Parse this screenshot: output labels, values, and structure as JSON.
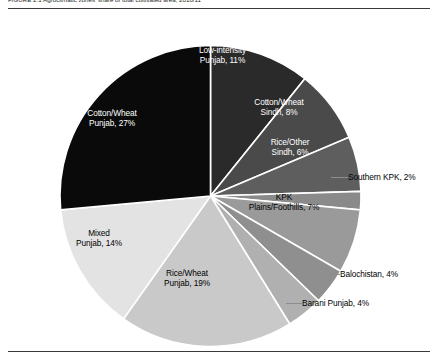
{
  "figure": {
    "caption": "FIGURE 2.1  Agroclimatic zones' share of total cultivated area, 2010/11",
    "rule_color": "#3a3a3a"
  },
  "chart_data": {
    "type": "pie",
    "title": "Agroclimatic zones' share of total cultivated area, 2010/11",
    "xlabel": "",
    "ylabel": "",
    "legend_position": "none",
    "grid": false,
    "start_angle_deg": 0,
    "direction": "clockwise",
    "unit": "percent",
    "categories": [
      "Low-intensity Punjab",
      "Cotton/Wheat Sindh",
      "Rice/Other Sindh",
      "Southern KPK",
      "KPK Plains/Foothills",
      "Balochistan",
      "Barani Punjab",
      "Rice/Wheat Punjab",
      "Mixed Punjab",
      "Cotton/Wheat Punjab"
    ],
    "values": [
      11,
      8,
      6,
      2,
      7,
      4,
      4,
      19,
      14,
      27
    ],
    "colors": [
      "#2a2a2a",
      "#4a4a4a",
      "#5e5e5e",
      "#8a8a8a",
      "#9a9a9a",
      "#8f8f8f",
      "#b0b0b0",
      "#c9c9c9",
      "#e3e3e3",
      "#0a0a0a"
    ],
    "slices": [
      {
        "label": "Low-intensity\nPunjab, 11%",
        "name": "low-intensity-punjab",
        "value": 11,
        "color": "#2a2a2a",
        "text_color": "light",
        "placement": "inside"
      },
      {
        "label": "Cotton/Wheat\nSindh, 8%",
        "name": "cotton-wheat-sindh",
        "value": 8,
        "color": "#4a4a4a",
        "text_color": "light",
        "placement": "inside"
      },
      {
        "label": "Rice/Other\nSindh, 6%",
        "name": "rice-other-sindh",
        "value": 6,
        "color": "#5e5e5e",
        "text_color": "light",
        "placement": "inside"
      },
      {
        "label": "Southern KPK, 2%",
        "name": "southern-kpk",
        "value": 2,
        "color": "#8a8a8a",
        "text_color": "dark",
        "placement": "outside"
      },
      {
        "label": "KPK\nPlains/Foothills, 7%",
        "name": "kpk-plains-foothills",
        "value": 7,
        "color": "#9a9a9a",
        "text_color": "dark",
        "placement": "inside"
      },
      {
        "label": "Balochistan, 4%",
        "name": "balochistan",
        "value": 4,
        "color": "#8f8f8f",
        "text_color": "dark",
        "placement": "outside"
      },
      {
        "label": "Barani Punjab, 4%",
        "name": "barani-punjab",
        "value": 4,
        "color": "#b0b0b0",
        "text_color": "dark",
        "placement": "outside"
      },
      {
        "label": "Rice/Wheat\nPunjab, 19%",
        "name": "rice-wheat-punjab",
        "value": 19,
        "color": "#c9c9c9",
        "text_color": "dark",
        "placement": "inside"
      },
      {
        "label": "Mixed\nPunjab, 14%",
        "name": "mixed-punjab",
        "value": 14,
        "color": "#e3e3e3",
        "text_color": "dark",
        "placement": "inside"
      },
      {
        "label": "Cotton/Wheat\nPunjab, 27%",
        "name": "cotton-wheat-punjab",
        "value": 27,
        "color": "#0a0a0a",
        "text_color": "light",
        "placement": "inside"
      }
    ]
  }
}
